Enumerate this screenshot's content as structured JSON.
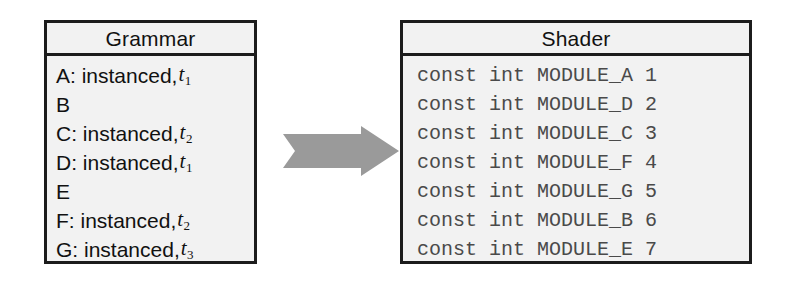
{
  "colors": {
    "panel_fill": "#f2f2f2",
    "panel_border": "#1c1c1c",
    "grammar_text": "#111111",
    "shader_text": "#4a4a4a",
    "arrow_fill": "#9a9a9a",
    "page_background": "#ffffff"
  },
  "grammar": {
    "title": "Grammar",
    "rows": [
      {
        "label": "A: instanced,",
        "time_var": "t",
        "time_index": "1"
      },
      {
        "label": "B",
        "time_var": "",
        "time_index": ""
      },
      {
        "label": "C: instanced,",
        "time_var": "t",
        "time_index": "2"
      },
      {
        "label": "D: instanced,",
        "time_var": "t",
        "time_index": "1"
      },
      {
        "label": "E",
        "time_var": "",
        "time_index": ""
      },
      {
        "label": "F: instanced,",
        "time_var": "t",
        "time_index": "2"
      },
      {
        "label": "G: instanced,",
        "time_var": "t",
        "time_index": "3"
      }
    ]
  },
  "arrow": {
    "icon": "right-block-arrow-icon",
    "direction": "right"
  },
  "shader": {
    "title": "Shader",
    "rows": [
      "const int MODULE_A 1",
      "const int MODULE_D 2",
      "const int MODULE_C 3",
      "const int MODULE_F 4",
      "const int MODULE_G 5",
      "const int MODULE_B 6",
      "const int MODULE_E 7"
    ]
  }
}
